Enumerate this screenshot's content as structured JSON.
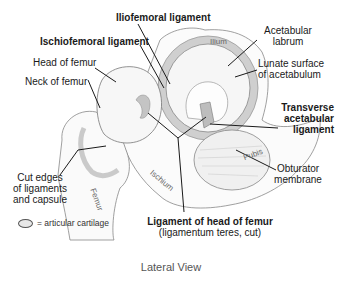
{
  "title": "Lateral View",
  "labels": {
    "iliofemoral": "Iliofemoral ligament",
    "ischiofemoral": "Ischiofemoral ligament",
    "head_of_femur": "Head of femur",
    "neck_of_femur": "Neck of femur",
    "acetabular_labrum_1": "Acetabular",
    "acetabular_labrum_2": "labrum",
    "lunate_1": "Lunate surface",
    "lunate_2": "of acetabulum",
    "transverse_1": "Transverse",
    "transverse_2": "acetabular",
    "transverse_3": "ligament",
    "cut_edges_1": "Cut edges",
    "cut_edges_2": "of ligaments",
    "cut_edges_3": "and capsule",
    "obturator_1": "Obturator",
    "obturator_2": "membrane",
    "lig_head_1": "Ligament of head of femur",
    "lig_head_2": "(ligamentum teres, cut)"
  },
  "bones": {
    "ilium": "Ilium",
    "ischium": "Ischium",
    "pubis": "Pubis",
    "femur": "Femur"
  },
  "legend": {
    "text": "= articular cartilage"
  },
  "colors": {
    "line": "#1a1a1a",
    "sketch": "#777777",
    "cartilage": "#f4f4f4",
    "ligament_shade": "#b0b0b0"
  }
}
